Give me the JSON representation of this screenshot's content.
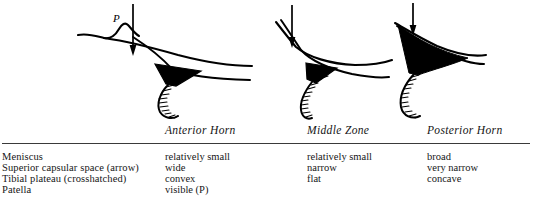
{
  "figure": {
    "kind": "anatomical-line-drawing-with-comparison-table"
  },
  "drawings": [
    {
      "name": "anterior-horn-drawing",
      "zone": "Anterior Horn",
      "patella_label": "P",
      "meniscus": "relatively small",
      "capsular_space": "wide",
      "tibial_plateau": "convex",
      "arrow": "down-arrow",
      "patella_visible": true
    },
    {
      "name": "middle-zone-drawing",
      "zone": "Middle Zone",
      "patella_label": "",
      "meniscus": "relatively small",
      "capsular_space": "narrow",
      "tibial_plateau": "flat",
      "arrow": "down-arrow",
      "patella_visible": false
    },
    {
      "name": "posterior-horn-drawing",
      "zone": "Posterior Horn",
      "patella_label": "",
      "meniscus": "broad",
      "capsular_space": "very narrow",
      "tibial_plateau": "concave",
      "arrow": "down-arrow",
      "patella_visible": false
    }
  ],
  "table": {
    "column_headers": [
      "Anterior Horn",
      "Middle Zone",
      "Posterior Horn"
    ],
    "row_labels": [
      "Meniscus",
      "Superior capsular space (arrow)",
      "Tibial plateau (crosshatched)",
      "Patella"
    ],
    "rows": [
      {
        "label": "Meniscus",
        "anterior": "relatively small",
        "middle": "relatively small",
        "posterior": "broad"
      },
      {
        "label": "Superior capsular space (arrow)",
        "anterior": "wide",
        "middle": "narrow",
        "posterior": "very narrow"
      },
      {
        "label": "Tibial plateau (crosshatched)",
        "anterior": "convex",
        "middle": "flat",
        "posterior": "concave"
      },
      {
        "label": "Patella",
        "anterior": "visible (P)",
        "middle": "",
        "posterior": ""
      }
    ]
  },
  "colors": {
    "background": "#ffffff",
    "ink": "#000000",
    "rule": "#3a3a3a",
    "text": "#161616"
  }
}
